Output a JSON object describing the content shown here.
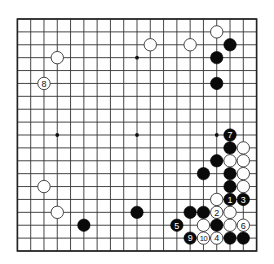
{
  "board": {
    "size": 19,
    "colors": {
      "background": "#ffffff",
      "line": "#333333",
      "black": "#0a0a0a",
      "white": "#ffffff"
    },
    "star_points": [
      [
        3,
        3
      ],
      [
        9,
        3
      ],
      [
        15,
        3
      ],
      [
        3,
        9
      ],
      [
        9,
        9
      ],
      [
        15,
        9
      ],
      [
        3,
        15
      ],
      [
        9,
        15
      ],
      [
        15,
        15
      ]
    ],
    "stones": [
      {
        "color": "white",
        "col": 3,
        "row": 3,
        "label": ""
      },
      {
        "color": "white",
        "col": 2,
        "row": 5,
        "label": "8"
      },
      {
        "color": "white",
        "col": 10,
        "row": 2,
        "label": ""
      },
      {
        "color": "white",
        "col": 13,
        "row": 2,
        "label": ""
      },
      {
        "color": "white",
        "col": 15,
        "row": 1,
        "label": ""
      },
      {
        "color": "black",
        "col": 16,
        "row": 2,
        "label": ""
      },
      {
        "color": "black",
        "col": 15,
        "row": 3,
        "label": ""
      },
      {
        "color": "black",
        "col": 15,
        "row": 5,
        "label": ""
      },
      {
        "color": "black",
        "col": 16,
        "row": 9,
        "label": "7"
      },
      {
        "color": "black",
        "col": 16,
        "row": 10,
        "label": ""
      },
      {
        "color": "white",
        "col": 17,
        "row": 10,
        "label": ""
      },
      {
        "color": "black",
        "col": 15,
        "row": 11,
        "label": ""
      },
      {
        "color": "white",
        "col": 16,
        "row": 11,
        "label": ""
      },
      {
        "color": "white",
        "col": 17,
        "row": 11,
        "label": ""
      },
      {
        "color": "black",
        "col": 14,
        "row": 12,
        "label": ""
      },
      {
        "color": "black",
        "col": 16,
        "row": 12,
        "label": ""
      },
      {
        "color": "white",
        "col": 17,
        "row": 12,
        "label": ""
      },
      {
        "color": "black",
        "col": 16,
        "row": 13,
        "label": ""
      },
      {
        "color": "white",
        "col": 17,
        "row": 13,
        "label": ""
      },
      {
        "color": "white",
        "col": 15,
        "row": 14,
        "label": ""
      },
      {
        "color": "black",
        "col": 16,
        "row": 14,
        "label": "1"
      },
      {
        "color": "black",
        "col": 17,
        "row": 14,
        "label": "3"
      },
      {
        "color": "black",
        "col": 13,
        "row": 15,
        "label": ""
      },
      {
        "color": "black",
        "col": 14,
        "row": 15,
        "label": ""
      },
      {
        "color": "white",
        "col": 15,
        "row": 15,
        "label": "2"
      },
      {
        "color": "white",
        "col": 16,
        "row": 15,
        "label": ""
      },
      {
        "color": "black",
        "col": 12,
        "row": 16,
        "label": "5"
      },
      {
        "color": "white",
        "col": 14,
        "row": 16,
        "label": ""
      },
      {
        "color": "black",
        "col": 15,
        "row": 16,
        "label": ""
      },
      {
        "color": "white",
        "col": 16,
        "row": 16,
        "label": ""
      },
      {
        "color": "white",
        "col": 17,
        "row": 16,
        "label": "6"
      },
      {
        "color": "black",
        "col": 13,
        "row": 17,
        "label": "9"
      },
      {
        "color": "white",
        "col": 14,
        "row": 17,
        "label": "10"
      },
      {
        "color": "white",
        "col": 15,
        "row": 17,
        "label": "4"
      },
      {
        "color": "black",
        "col": 16,
        "row": 17,
        "label": ""
      },
      {
        "color": "black",
        "col": 17,
        "row": 17,
        "label": ""
      },
      {
        "color": "white",
        "col": 2,
        "row": 13,
        "label": ""
      },
      {
        "color": "white",
        "col": 3,
        "row": 15,
        "label": ""
      },
      {
        "color": "black",
        "col": 5,
        "row": 16,
        "label": ""
      },
      {
        "color": "black",
        "col": 9,
        "row": 15,
        "label": ""
      }
    ]
  }
}
